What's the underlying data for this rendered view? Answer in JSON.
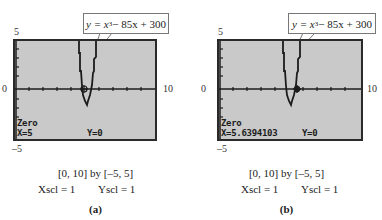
{
  "figure": {
    "panels": [
      {
        "id": "a",
        "callout": {
          "prefix": "y = x",
          "exponent": "3",
          "suffix": " − 85x + 300"
        },
        "equation_text": "y = x^3 − 85x + 300",
        "axis_labels": {
          "ymax": "5",
          "ymin": "–5",
          "xmin": "0",
          "xmax": "10"
        },
        "screen_text": {
          "mode": "Zero",
          "x_readout": "X=5",
          "y_readout": "Y=0"
        },
        "window": {
          "range": "[0, 10]  by  [–5, 5]",
          "xscl": "Xscl = 1",
          "yscl": "Yscl = 1"
        },
        "label": "(a)",
        "cursor_x": 5
      },
      {
        "id": "b",
        "callout": {
          "prefix": "y = x",
          "exponent": "3",
          "suffix": " − 85x + 300"
        },
        "equation_text": "y = x^3 − 85x + 300",
        "axis_labels": {
          "ymax": "5",
          "ymin": "–5",
          "xmin": "0",
          "xmax": "10"
        },
        "screen_text": {
          "mode": "Zero",
          "x_readout": "X=5.6394103",
          "y_readout": "Y=0"
        },
        "window": {
          "range": "[0, 10]  by  [–5, 5]",
          "xscl": "Xscl = 1",
          "yscl": "Yscl = 1"
        },
        "label": "(b)",
        "cursor_x": 5.6394103
      }
    ],
    "colors": {
      "screen_bg": "#c9c9c9",
      "screen_border": "#2a2a2a",
      "ink": "#1c1c1c"
    }
  }
}
